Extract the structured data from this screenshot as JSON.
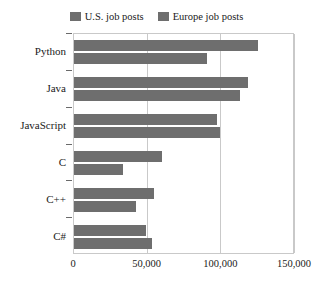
{
  "chart_data": {
    "type": "bar",
    "orientation": "horizontal",
    "title": "",
    "xlabel": "",
    "ylabel": "",
    "xlim": [
      0,
      150000
    ],
    "ylim": null,
    "grid": true,
    "legend_position": "top-center",
    "categories": [
      "Python",
      "Java",
      "JavaScript",
      "C",
      "C++",
      "C#"
    ],
    "xticks": [
      0,
      50000,
      100000,
      150000
    ],
    "xticklabels": [
      "0",
      "50,000",
      "100,000",
      "150,000"
    ],
    "series": [
      {
        "name": "U.S. job posts",
        "color": "#6e6e6e",
        "values": [
          125000,
          118000,
          97000,
          60000,
          54000,
          49000
        ]
      },
      {
        "name": "Europe job posts",
        "color": "#6e6e6e",
        "values": [
          90500,
          113000,
          99000,
          33000,
          42000,
          53000
        ]
      }
    ]
  },
  "legend": {
    "entries": [
      {
        "label": "U.S. job posts",
        "swatch_color": "#6e6e6e"
      },
      {
        "label": "Europe job posts",
        "swatch_color": "#6e6e6e"
      }
    ]
  },
  "axes": {
    "frame_color": "#c9c9c9",
    "tick_color": "#6a6a6a"
  }
}
